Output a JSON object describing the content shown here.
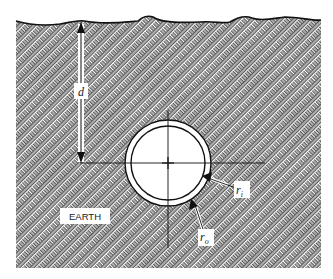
{
  "diagram": {
    "labels": {
      "depth": "d",
      "material": "EARTH",
      "inner_radius": "r",
      "inner_radius_sub": "i",
      "outer_radius": "r",
      "outer_radius_sub": "o"
    },
    "colors": {
      "line": "#111111",
      "hatch": "#555555",
      "background": "#ffffff"
    }
  }
}
